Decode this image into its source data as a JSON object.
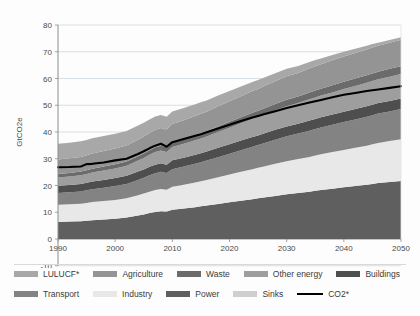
{
  "chart_data": {
    "type": "area",
    "title": "",
    "subtitle": "",
    "xlabel": "",
    "ylabel": "GtCO2e",
    "xlim": [
      1990,
      2050
    ],
    "ylim": [
      -10,
      80
    ],
    "ytick_values": [
      -10,
      0,
      10,
      20,
      30,
      40,
      50,
      60,
      70,
      80
    ],
    "ytick_labels": [
      "-10",
      "0",
      "10",
      "20",
      "30",
      "40",
      "50",
      "60",
      "70",
      "80"
    ],
    "xtick_values": [
      1990,
      2000,
      2010,
      2020,
      2030,
      2040,
      2050
    ],
    "xtick_labels": [
      "1990",
      "2000",
      "2010",
      "2020",
      "2030",
      "2040",
      "2050"
    ],
    "grid": "horizontal",
    "legend_position": "bottom",
    "stacked": true,
    "x": [
      1990,
      1992,
      1994,
      1995,
      1996,
      1998,
      2000,
      2002,
      2004,
      2005,
      2006,
      2007,
      2008,
      2009,
      2010,
      2012,
      2014,
      2015,
      2016,
      2018,
      2020,
      2022,
      2024,
      2025,
      2026,
      2028,
      2030,
      2032,
      2034,
      2035,
      2036,
      2038,
      2040,
      2042,
      2044,
      2045,
      2046,
      2048,
      2050
    ],
    "series": [
      {
        "name": "Power",
        "color": "#5f5f5f",
        "stack_order": 1,
        "values": [
          6.4,
          6.5,
          6.6,
          6.8,
          7.0,
          7.3,
          7.6,
          8.0,
          8.8,
          9.2,
          9.7,
          10.1,
          10.4,
          10.3,
          10.9,
          11.4,
          11.9,
          12.2,
          12.5,
          13.1,
          13.7,
          14.3,
          14.9,
          15.2,
          15.5,
          16.1,
          16.7,
          17.2,
          17.7,
          18.0,
          18.3,
          18.8,
          19.3,
          19.8,
          20.3,
          20.6,
          20.9,
          21.3,
          21.7
        ]
      },
      {
        "name": "Industry",
        "color": "#e8e8e8",
        "stack_order": 2,
        "values": [
          6.4,
          6.5,
          6.6,
          6.7,
          6.8,
          6.9,
          7.0,
          7.2,
          7.6,
          7.8,
          8.0,
          8.2,
          8.3,
          8.1,
          8.6,
          8.9,
          9.2,
          9.4,
          9.6,
          10.0,
          10.4,
          10.8,
          11.2,
          11.4,
          11.6,
          12.0,
          12.4,
          12.7,
          13.0,
          13.2,
          13.4,
          13.7,
          14.0,
          14.3,
          14.6,
          14.8,
          15.0,
          15.3,
          15.6
        ]
      },
      {
        "name": "Transport",
        "color": "#838383",
        "stack_order": 3,
        "values": [
          4.4,
          4.5,
          4.6,
          4.7,
          4.8,
          5.0,
          5.2,
          5.4,
          5.7,
          5.9,
          6.1,
          6.3,
          6.4,
          6.3,
          6.6,
          6.8,
          7.0,
          7.1,
          7.2,
          7.5,
          7.8,
          8.1,
          8.4,
          8.5,
          8.7,
          9.0,
          9.3,
          9.5,
          9.8,
          9.9,
          10.0,
          10.2,
          10.4,
          10.6,
          10.8,
          10.9,
          11.0,
          11.1,
          11.3
        ]
      },
      {
        "name": "Buildings",
        "color": "#4e4e4e",
        "stack_order": 4,
        "values": [
          2.7,
          2.7,
          2.8,
          2.8,
          2.9,
          2.9,
          3.0,
          3.0,
          3.1,
          3.1,
          3.2,
          3.2,
          3.2,
          3.1,
          3.3,
          3.3,
          3.4,
          3.4,
          3.4,
          3.5,
          3.5,
          3.6,
          3.6,
          3.6,
          3.6,
          3.7,
          3.7,
          3.7,
          3.8,
          3.8,
          3.8,
          3.8,
          3.9,
          3.9,
          3.9,
          3.9,
          3.9,
          3.9,
          3.9
        ]
      },
      {
        "name": "Other energy",
        "color": "#9e9e9e",
        "stack_order": 5,
        "values": [
          3.1,
          3.2,
          3.2,
          3.3,
          3.4,
          3.5,
          3.6,
          3.8,
          4.1,
          4.3,
          4.5,
          4.7,
          4.8,
          4.7,
          5.0,
          5.2,
          5.4,
          5.5,
          5.6,
          5.9,
          6.2,
          6.5,
          6.8,
          6.9,
          7.0,
          7.3,
          7.5,
          7.7,
          7.9,
          8.0,
          8.1,
          8.3,
          8.5,
          8.6,
          8.8,
          8.9,
          8.9,
          9.1,
          9.2
        ]
      },
      {
        "name": "Waste",
        "color": "#6b6b6b",
        "stack_order": 6,
        "values": [
          1.3,
          1.3,
          1.4,
          1.4,
          1.4,
          1.5,
          1.5,
          1.6,
          1.6,
          1.7,
          1.7,
          1.8,
          1.8,
          1.8,
          1.9,
          1.9,
          2.0,
          2.0,
          2.0,
          2.1,
          2.2,
          2.2,
          2.3,
          2.3,
          2.4,
          2.4,
          2.5,
          2.5,
          2.6,
          2.6,
          2.6,
          2.7,
          2.7,
          2.8,
          2.8,
          2.8,
          2.8,
          2.9,
          2.9
        ]
      },
      {
        "name": "Agriculture",
        "color": "#949494",
        "stack_order": 7,
        "values": [
          5.4,
          5.5,
          5.5,
          5.6,
          5.7,
          5.8,
          5.9,
          6.0,
          6.2,
          6.3,
          6.4,
          6.5,
          6.6,
          6.6,
          6.7,
          6.9,
          7.1,
          7.2,
          7.3,
          7.5,
          7.7,
          7.9,
          8.1,
          8.2,
          8.3,
          8.5,
          8.7,
          8.8,
          9.0,
          9.1,
          9.1,
          9.3,
          9.4,
          9.5,
          9.6,
          9.7,
          9.7,
          9.8,
          9.9
        ]
      },
      {
        "name": "LULUCF*",
        "color": "#a8a8a8",
        "stack_order": 8,
        "values": [
          5.9,
          5.8,
          5.8,
          5.7,
          5.7,
          5.6,
          5.5,
          5.4,
          5.3,
          5.2,
          5.1,
          5.0,
          4.9,
          4.8,
          4.7,
          4.6,
          4.4,
          4.3,
          4.2,
          4.0,
          3.8,
          3.6,
          3.4,
          3.3,
          3.2,
          3.0,
          2.8,
          2.6,
          2.4,
          2.3,
          2.2,
          2.0,
          1.8,
          1.6,
          1.4,
          1.3,
          1.2,
          1.0,
          0.9
        ]
      },
      {
        "name": "Sinks",
        "color": "#cfcfcf",
        "stack_order": 9,
        "values": [
          0,
          0,
          0,
          0,
          0,
          0,
          0,
          0,
          0,
          0,
          0,
          0,
          0,
          0,
          0,
          0,
          0,
          0,
          0,
          0,
          0,
          0,
          0,
          0,
          0,
          0,
          0,
          0,
          0,
          0,
          0,
          0,
          0,
          0,
          0,
          0,
          0,
          0,
          0
        ]
      }
    ],
    "line_series": {
      "name": "CO2*",
      "color": "#000000",
      "values": [
        26.8,
        26.9,
        27.1,
        28.0,
        28.1,
        28.6,
        29.4,
        30.0,
        31.8,
        32.8,
        33.9,
        34.9,
        35.6,
        34.5,
        36.2,
        37.4,
        38.6,
        39.2,
        39.9,
        41.3,
        42.7,
        44.1,
        45.4,
        46.0,
        46.6,
        47.8,
        49.0,
        50.0,
        51.0,
        51.5,
        52.0,
        53.0,
        53.9,
        54.6,
        55.3,
        55.6,
        55.9,
        56.5,
        57.1
      ]
    }
  },
  "legend": {
    "rows": [
      [
        {
          "label": "LULUCF*",
          "color": "#a8a8a8",
          "kind": "swatch"
        },
        {
          "label": "Agriculture",
          "color": "#949494",
          "kind": "swatch"
        },
        {
          "label": "Waste",
          "color": "#6b6b6b",
          "kind": "swatch"
        },
        {
          "label": "Other energy",
          "color": "#9e9e9e",
          "kind": "swatch"
        },
        {
          "label": "Buildings",
          "color": "#4e4e4e",
          "kind": "swatch"
        }
      ],
      [
        {
          "label": "Transport",
          "color": "#838383",
          "kind": "swatch"
        },
        {
          "label": "Industry",
          "color": "#e8e8e8",
          "kind": "swatch"
        },
        {
          "label": "Power",
          "color": "#5f5f5f",
          "kind": "swatch"
        },
        {
          "label": "Sinks",
          "color": "#cfcfcf",
          "kind": "swatch"
        },
        {
          "label": "CO2*",
          "color": "#000000",
          "kind": "line"
        }
      ]
    ]
  },
  "colors": {
    "axis": "#8c8c8c",
    "grid": "#cfd7e3",
    "text": "#3b3b3b",
    "background": "#fdfdfd",
    "line": "#000000"
  }
}
